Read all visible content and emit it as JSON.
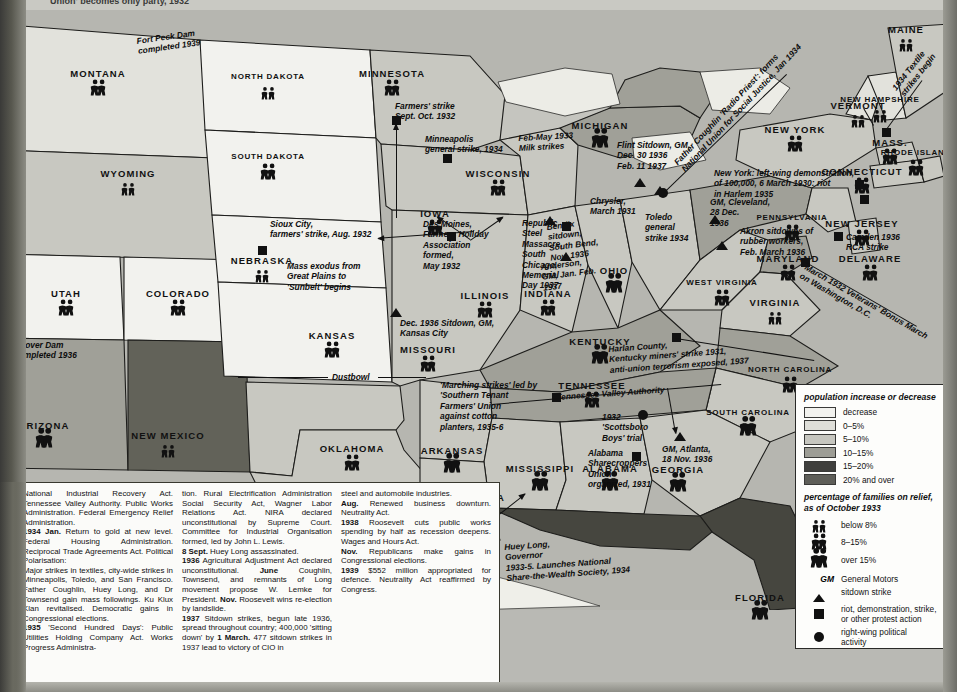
{
  "page": {
    "top_cut_caption": "Union' becomes only party, 1932",
    "background_color": "#b9b9b4"
  },
  "legend": {
    "population_title": "population increase\nor decrease",
    "population_classes": [
      {
        "label": "decrease",
        "color": "#f2f2ee"
      },
      {
        "label": "0–5%",
        "color": "#dedeD8"
      },
      {
        "label": "5–10%",
        "color": "#c6c6bf"
      },
      {
        "label": "10–15%",
        "color": "#9d9d95"
      },
      {
        "label": "15–20%",
        "color": "#3f3f3c"
      },
      {
        "label": "20% and over",
        "color": "#5e5e58"
      }
    ],
    "relief_title": "percentage of families on\nrelief, as of October 1933",
    "relief_classes": [
      {
        "label": "below 8%",
        "size": "small"
      },
      {
        "label": "8–15%",
        "size": "medium"
      },
      {
        "label": "over 15%",
        "size": "large"
      }
    ],
    "symbols": [
      {
        "mark": "GM",
        "label": "General Motors"
      },
      {
        "mark": "triangle",
        "label": "sitdown strike"
      },
      {
        "mark": "square",
        "label": "riot, demonstration, strike,\nor other protest action"
      },
      {
        "mark": "circle",
        "label": "right-wing political\nactivity"
      }
    ]
  },
  "states": [
    {
      "name": "MONTANA",
      "x": 98,
      "y": 68,
      "relief": "medium"
    },
    {
      "name": "NORTH DAKOTA",
      "x": 268,
      "y": 72,
      "relief": "small"
    },
    {
      "name": "SOUTH DAKOTA",
      "x": 268,
      "y": 152,
      "relief": "medium"
    },
    {
      "name": "MINNESOTA",
      "x": 392,
      "y": 68,
      "relief": "medium"
    },
    {
      "name": "WISCONSIN",
      "x": 498,
      "y": 168,
      "relief": "medium"
    },
    {
      "name": "WYOMING",
      "x": 128,
      "y": 168,
      "relief": "small"
    },
    {
      "name": "IOWA",
      "x": 435,
      "y": 208,
      "relief": "medium"
    },
    {
      "name": "NEBRASKA",
      "x": 262,
      "y": 255,
      "relief": "small"
    },
    {
      "name": "UTAH",
      "x": 66,
      "y": 288,
      "relief": "medium"
    },
    {
      "name": "COLORADO",
      "x": 178,
      "y": 288,
      "relief": "medium"
    },
    {
      "name": "KANSAS",
      "x": 332,
      "y": 330,
      "relief": "medium"
    },
    {
      "name": "MISSOURI",
      "x": 428,
      "y": 344,
      "relief": "medium"
    },
    {
      "name": "ILLINOIS",
      "x": 485,
      "y": 290,
      "relief": "medium"
    },
    {
      "name": "INDIANA",
      "x": 548,
      "y": 288,
      "relief": "medium"
    },
    {
      "name": "OHIO",
      "x": 614,
      "y": 265,
      "relief": "large"
    },
    {
      "name": "KENTUCKY",
      "x": 600,
      "y": 336,
      "relief": "large"
    },
    {
      "name": "ARIZONA",
      "x": 44,
      "y": 420,
      "relief": "large"
    },
    {
      "name": "NEW MEXICO",
      "x": 168,
      "y": 430,
      "relief": "small"
    },
    {
      "name": "OKLAHOMA",
      "x": 352,
      "y": 443,
      "relief": "medium"
    },
    {
      "name": "ARKANSAS",
      "x": 452,
      "y": 445,
      "relief": "large"
    },
    {
      "name": "TEXAS",
      "x": 372,
      "y": 495,
      "relief": "medium"
    },
    {
      "name": "LOUISIANA",
      "x": 474,
      "y": 492,
      "relief": "large"
    },
    {
      "name": "MISSISSIPPI",
      "x": 540,
      "y": 463,
      "relief": "large"
    },
    {
      "name": "ALABAMA",
      "x": 610,
      "y": 463,
      "relief": "large"
    },
    {
      "name": "TENNESSEE",
      "x": 592,
      "y": 380,
      "relief": "medium"
    },
    {
      "name": "GEORGIA",
      "x": 678,
      "y": 464,
      "relief": "large"
    },
    {
      "name": "FLORIDA",
      "x": 760,
      "y": 592,
      "relief": "large"
    },
    {
      "name": "SOUTH CAROLINA",
      "x": 748,
      "y": 408,
      "relief": "large"
    },
    {
      "name": "NORTH CAROLINA",
      "x": 790,
      "y": 365,
      "relief": "medium"
    },
    {
      "name": "VIRGINIA",
      "x": 775,
      "y": 297,
      "relief": "small"
    },
    {
      "name": "WEST VIRGINIA",
      "x": 722,
      "y": 278,
      "relief": "medium"
    },
    {
      "name": "PENNSYLVANIA",
      "x": 792,
      "y": 213,
      "relief": "medium"
    },
    {
      "name": "MARYLAND",
      "x": 788,
      "y": 253,
      "relief": "medium"
    },
    {
      "name": "DELAWARE",
      "x": 870,
      "y": 253,
      "relief": "medium"
    },
    {
      "name": "NEW JERSEY",
      "x": 862,
      "y": 218,
      "relief": "medium"
    },
    {
      "name": "NEW YORK",
      "x": 795,
      "y": 124,
      "relief": "medium"
    },
    {
      "name": "MASS.",
      "x": 890,
      "y": 137,
      "relief": "medium"
    },
    {
      "name": "CONNECTICUT",
      "x": 862,
      "y": 166,
      "relief": "medium"
    },
    {
      "name": "RHODE ISLAND",
      "x": 916,
      "y": 148,
      "relief": "medium"
    },
    {
      "name": "VERMONT",
      "x": 858,
      "y": 100,
      "relief": "small"
    },
    {
      "name": "NEW HAMPSHIRE",
      "x": 880,
      "y": 95,
      "relief": "small"
    },
    {
      "name": "MAINE",
      "x": 906,
      "y": 24,
      "relief": "small"
    },
    {
      "name": "MICHIGAN",
      "x": 600,
      "y": 120,
      "relief": "large"
    },
    {
      "name": "IDAHO",
      "x": 8,
      "y": 148,
      "relief": "small"
    }
  ],
  "annotations": [
    {
      "id": "fort-peck",
      "text": "Fort Peck Dam\ncompleted 1939",
      "x": 136,
      "y": 36,
      "rot": -8
    },
    {
      "id": "farmers-strike-mn",
      "text": "Farmers' strike\nSept.  Oct. 1932",
      "x": 395,
      "y": 101,
      "rot": 0
    },
    {
      "id": "minneapolis",
      "text": "Minneapolis\ngeneral strike, 1934",
      "x": 425,
      "y": 134,
      "rot": 0
    },
    {
      "id": "milk-strikes",
      "text": "Feb-May 1933\nMilk strikes",
      "x": 518,
      "y": 133,
      "rot": -3
    },
    {
      "id": "sioux-city",
      "text": "Sioux City,\nfarmers' strike, Aug. 1932",
      "x": 270,
      "y": 219,
      "rot": 0
    },
    {
      "id": "mass-exodus",
      "text": "Mass exodus from\nGreat Plains to\n'Sunbelt' begins",
      "x": 287,
      "y": 261,
      "rot": 0
    },
    {
      "id": "des-moines",
      "text": "Des Moines,\nFarmers Holiday\nAssociation\nformed,\nMay 1932",
      "x": 423,
      "y": 219,
      "rot": 0
    },
    {
      "id": "kansas-city-sitdown",
      "text": "Dec. 1936 Sitdown, GM,\nKansas City",
      "x": 400,
      "y": 318,
      "rot": 0
    },
    {
      "id": "dustbowl",
      "text": "Dustbowl",
      "x": 332,
      "y": 372,
      "rot": 0
    },
    {
      "id": "hoover-dam",
      "text": "Hoover Dam\ncompleted 1936",
      "x": 14,
      "y": 340,
      "rot": 0
    },
    {
      "id": "republic-steel",
      "text": "Republic\nSteel\nMassacre,\nSouth\nChicago,\nMemorial\nDay 1937",
      "x": 522,
      "y": 218,
      "rot": 0
    },
    {
      "id": "bendix",
      "text": "Bendix\nsitdown,\nSouth Bend,\nNov. 1936",
      "x": 546,
      "y": 222,
      "rot": -7
    },
    {
      "id": "anderson",
      "text": "Anderson,\nGM, Jan.  Feb.\n1937",
      "x": 540,
      "y": 262,
      "rot": -7
    },
    {
      "id": "chrysler",
      "text": "Chrysler,\nMarch 1931",
      "x": 590,
      "y": 196,
      "rot": 0
    },
    {
      "id": "toledo",
      "text": "Toledo\ngeneral\nstrike 1934",
      "x": 645,
      "y": 212,
      "rot": 0
    },
    {
      "id": "flint",
      "text": "Flint Sitdown, GM,\nDec. 30 1936\nFeb. 11 1937",
      "x": 617,
      "y": 140,
      "rot": 0
    },
    {
      "id": "coughlin",
      "text": "Father Coughlin  'Radio Priest': forms\nNational Union for Social Justice, Jan 1934",
      "x": 672,
      "y": 160,
      "rot": -47
    },
    {
      "id": "gm-cleveland",
      "text": "GM, Cleveland,\n28 Dec.\n1936",
      "x": 710,
      "y": 197,
      "rot": 0
    },
    {
      "id": "akron",
      "text": "Akron sitdowns of\nrubber workers,\nFeb.  March 1936",
      "x": 740,
      "y": 226,
      "rot": 0
    },
    {
      "id": "new-york-demo",
      "text": "New York: left-wing demonstration,\nof 100,000, 6 March 1930: riot\nin Harlem 1935",
      "x": 714,
      "y": 168,
      "rot": 0
    },
    {
      "id": "camden",
      "text": "Camden 1936\nRCA strike",
      "x": 846,
      "y": 232,
      "rot": 0
    },
    {
      "id": "bonus-march",
      "text": "March 1932  Veterans' Bonus March\non Washington, D.C.",
      "x": 808,
      "y": 262,
      "rot": 30
    },
    {
      "id": "textile-strikes",
      "text": "1934 Textile\nstrikes begin",
      "x": 890,
      "y": 86,
      "rot": -52
    },
    {
      "id": "harlan",
      "text": "Harlan County,\nKentucky miners' strike 1931,\nanti-union terrorism exposed, 1937",
      "x": 608,
      "y": 344,
      "rot": -4
    },
    {
      "id": "tva",
      "text": "Tennessee Valley Authority",
      "x": 556,
      "y": 392,
      "rot": -4
    },
    {
      "id": "marching-strikes",
      "text": "'Marching strikes' led by\n'Southern Tenant\nFarmers' Union\nagainst cotton\nplanters, 1935-6",
      "x": 440,
      "y": 380,
      "rot": 0
    },
    {
      "id": "scottsboro",
      "text": "1932\n'Scottsboro\nBoys' trial",
      "x": 602,
      "y": 412,
      "rot": 0
    },
    {
      "id": "alabama-sharecroppers",
      "text": "Alabama\nSharecroppers\nUnion\norganized, 1931",
      "x": 588,
      "y": 448,
      "rot": 0
    },
    {
      "id": "gm-atlanta",
      "text": "GM, Atlanta,\n18 Nov. 1936",
      "x": 662,
      "y": 444,
      "rot": 0
    },
    {
      "id": "huey-long",
      "text": "Huey Long,\nGovernor\n1933-5. Launches National\nShare-the-Wealth Society, 1934",
      "x": 504,
      "y": 542,
      "rot": -4
    }
  ],
  "chronology": {
    "col1": [
      "National Industrial Recovery Act. Tennessee Valley Authority. Public Works Administration. Federal Emergency Relief Administration.",
      "<b>1934 Jan.</b> Return to gold at new level. Federal Housing Administration. Reciprocal Trade Agreements Act. Political Polarisation:",
      "Major strikes in textiles, city-wide strikes in Minneapolis, Toledo, and San Francisco. Father Coughlin, Huey Long, and Dr Townsend gain mass followings. Ku Klux Klan revitalised. Democratic gains in Congressional elections.",
      "<b>1935</b> 'Second Hundred Days': Public Utilities Holding Company Act. Works Progress Administra-"
    ],
    "col2": [
      "tion. Rural Electrification Administration Social Security Act, Wagner Labor Relations Act. NIRA declared unconstitutional by Supreme Court. Committee for Industrial Organisation formed, led by John L. Lewis.",
      "<b>8 Sept.</b> Huey Long assassinated.",
      "<b>1936</b> Agricultural Adjustment Act declared unconstitutional. <b>June</b> Coughlin, Townsend, and remnants of Long movement propose W. Lemke for President. <b>Nov.</b> Roosevelt wins re-election by landslide.",
      "<b>1937</b> Sitdown strikes, begun late 1936, spread throughout country; 400,000 'sitting down' by <b>1 March.</b> 477 sitdown strikes in 1937 lead to victory of CIO in"
    ],
    "col3": [
      "steel and automobile industries.",
      "<b>Aug.</b> Renewed business downturn. Neutrality Act.",
      "<b>1938</b> Roosevelt cuts public works spending by half as recession deepens. Wages and Hours Act.",
      "<b>Nov.</b> Republicans make gains in Congressional elections.",
      "<b>1939</b> $552 million appropriated for defence. Neutrality Act reaffirmed by Congress."
    ]
  }
}
